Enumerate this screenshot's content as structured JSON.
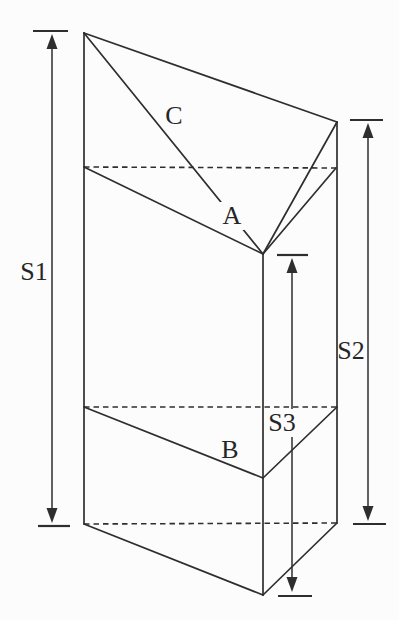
{
  "figure": {
    "type": "prism-section-diagram",
    "background_color": "#fcfcfc",
    "line_color": "#2e2e2e",
    "labels": {
      "s1": "S1",
      "s2": "S2",
      "s3": "S3",
      "a": "A",
      "b": "B",
      "c": "C"
    },
    "geometry": {
      "solid_lines": [
        {
          "name": "top-back-edge",
          "x1": 84,
          "y1": 33,
          "x2": 337,
          "y2": 122
        },
        {
          "name": "top-left-diagonal",
          "x1": 84,
          "y1": 33,
          "x2": 263,
          "y2": 254
        },
        {
          "name": "top-right-edge",
          "x1": 337,
          "y1": 122,
          "x2": 263,
          "y2": 254
        },
        {
          "name": "left-back-edge",
          "x1": 84,
          "y1": 33,
          "x2": 84,
          "y2": 524
        },
        {
          "name": "right-back-edge",
          "x1": 337,
          "y1": 122,
          "x2": 337,
          "y2": 523
        },
        {
          "name": "front-edge",
          "x1": 263,
          "y1": 254,
          "x2": 263,
          "y2": 595
        },
        {
          "name": "cut1-left-edge",
          "x1": 84,
          "y1": 167,
          "x2": 263,
          "y2": 254
        },
        {
          "name": "cut1-right-edge",
          "x1": 336,
          "y1": 168,
          "x2": 263,
          "y2": 254
        },
        {
          "name": "cut2-left-edge",
          "x1": 84,
          "y1": 407,
          "x2": 263,
          "y2": 478
        },
        {
          "name": "cut2-right-edge",
          "x1": 337,
          "y1": 407,
          "x2": 263,
          "y2": 478
        },
        {
          "name": "bottom-left-edge",
          "x1": 84,
          "y1": 524,
          "x2": 263,
          "y2": 595
        },
        {
          "name": "bottom-right-edge",
          "x1": 337,
          "y1": 523,
          "x2": 263,
          "y2": 595
        }
      ],
      "dashed_lines": [
        {
          "name": "cut1-back-edge",
          "x1": 84,
          "y1": 167,
          "x2": 336,
          "y2": 168
        },
        {
          "name": "cut2-back-edge",
          "x1": 84,
          "y1": 407,
          "x2": 337,
          "y2": 407
        },
        {
          "name": "bottom-back-edge",
          "x1": 84,
          "y1": 524,
          "x2": 337,
          "y2": 523
        }
      ],
      "dimension_arrows": [
        {
          "name": "s1",
          "x": 52,
          "y_top": 34,
          "y_bottom": 523,
          "tick_top": {
            "x1": 33,
            "x2": 68,
            "y": 31
          },
          "tick_bottom": {
            "x1": 38,
            "x2": 70,
            "y": 526
          }
        },
        {
          "name": "s2",
          "x": 368,
          "y_top": 123,
          "y_bottom": 521,
          "tick_top": {
            "x1": 350,
            "x2": 383,
            "y": 120
          },
          "tick_bottom": {
            "x1": 353,
            "x2": 386,
            "y": 524
          }
        },
        {
          "name": "s3",
          "x": 292,
          "y_top": 258,
          "y_bottom": 592,
          "tick_top": {
            "x1": 277,
            "x2": 308,
            "y": 255
          },
          "tick_bottom": {
            "x1": 278,
            "x2": 312,
            "y": 596
          }
        }
      ]
    }
  }
}
